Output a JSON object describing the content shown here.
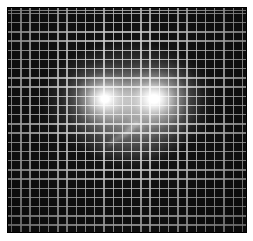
{
  "scene": {
    "type": "photograph-lights-behind-mesh-grid",
    "canvas": {
      "width": 253,
      "height": 241,
      "margin_color": "#ffffff"
    },
    "panel": {
      "x": 7,
      "y": 7,
      "width": 240,
      "height": 226,
      "background": "#131313",
      "border_color": "#000000"
    },
    "grid": {
      "columns": 26,
      "rows": 25,
      "spacing_x": 9.23,
      "spacing_y": 9.2,
      "line_color": "rgba(214,214,214,0.82)",
      "line_width": 1.4,
      "inset": 3,
      "cell_color": "#131313"
    },
    "vignette": {
      "center_x": 126,
      "center_y": 100,
      "edge_darkness": 0.5
    },
    "haze": [
      {
        "name": "main-haze",
        "cx": 128,
        "cy": 100,
        "rx": 88,
        "ry": 60,
        "opacity": 0.42
      },
      {
        "name": "lower-haze",
        "cx": 131,
        "cy": 125,
        "rx": 58,
        "ry": 44,
        "opacity": 0.3
      }
    ],
    "lights": [
      {
        "name": "left-light",
        "cx": 104,
        "cy": 98,
        "rx": 44,
        "ry": 38,
        "core_color": "#ffffff",
        "core_pct": 9
      },
      {
        "name": "right-light",
        "cx": 153,
        "cy": 98,
        "rx": 50,
        "ry": 42,
        "core_color": "#ffffff",
        "core_pct": 10
      }
    ],
    "streaks": [
      {
        "name": "flare-streak-main",
        "cx": 128,
        "cy": 129,
        "length": 38,
        "thickness": 9,
        "angle": -42,
        "opacity": 0.4
      },
      {
        "name": "flare-streak-secondary",
        "cx": 113,
        "cy": 139,
        "length": 24,
        "thickness": 7,
        "angle": -42,
        "opacity": 0.28
      },
      {
        "name": "flare-streak-cross",
        "cx": 136,
        "cy": 123,
        "length": 26,
        "thickness": 8,
        "angle": 38,
        "opacity": 0.22
      }
    ]
  }
}
